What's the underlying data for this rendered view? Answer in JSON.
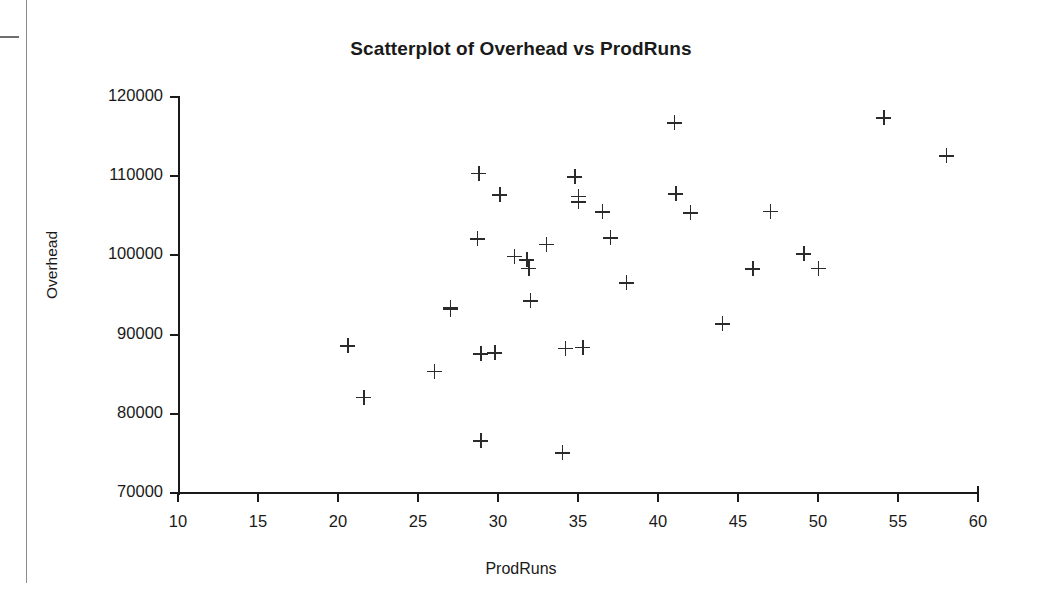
{
  "figure": {
    "title": "Scatterplot of Overhead vs ProdRuns",
    "xlabel": "ProdRuns",
    "ylabel": "Overhead"
  },
  "axes": {
    "x_ticks": [
      "10",
      "15",
      "20",
      "25",
      "30",
      "35",
      "40",
      "45",
      "50",
      "55",
      "60"
    ],
    "y_ticks": [
      "120000",
      "110000",
      "100000",
      "90000",
      "80000",
      "70000"
    ]
  },
  "chart_data": {
    "type": "scatter",
    "title": "Scatterplot of Overhead vs ProdRuns",
    "xlabel": "ProdRuns",
    "ylabel": "Overhead",
    "xlim": [
      10,
      60
    ],
    "ylim": [
      70000,
      120000
    ],
    "xticks": [
      10,
      15,
      20,
      25,
      30,
      35,
      40,
      45,
      50,
      55,
      60
    ],
    "yticks": [
      70000,
      80000,
      90000,
      100000,
      110000,
      120000
    ],
    "grid": false,
    "legend": null,
    "marker": "plus",
    "marker_color": "#2b2b2b",
    "series": [
      {
        "name": "Overhead vs ProdRuns",
        "points": [
          [
            20.6,
            88600
          ],
          [
            21.6,
            82100
          ],
          [
            26.0,
            85400
          ],
          [
            27.0,
            93200
          ],
          [
            27.0,
            93400
          ],
          [
            28.7,
            102100
          ],
          [
            28.8,
            110400
          ],
          [
            28.9,
            87600
          ],
          [
            28.9,
            76600
          ],
          [
            29.8,
            87700
          ],
          [
            30.1,
            107700
          ],
          [
            31.0,
            99900
          ],
          [
            31.8,
            99500
          ],
          [
            31.9,
            98400
          ],
          [
            32.0,
            94300
          ],
          [
            33.0,
            101400
          ],
          [
            34.0,
            75100
          ],
          [
            34.2,
            88300
          ],
          [
            34.8,
            109900
          ],
          [
            35.0,
            107500
          ],
          [
            35.0,
            106800
          ],
          [
            35.3,
            88400
          ],
          [
            36.5,
            105500
          ],
          [
            37.0,
            102200
          ],
          [
            38.0,
            96600
          ],
          [
            41.0,
            116800
          ],
          [
            41.1,
            107800
          ],
          [
            42.0,
            105400
          ],
          [
            44.0,
            91400
          ],
          [
            45.9,
            98300
          ],
          [
            47.0,
            105600
          ],
          [
            49.1,
            100200
          ],
          [
            50.0,
            98400
          ],
          [
            54.1,
            117400
          ],
          [
            58.0,
            112600
          ]
        ]
      }
    ]
  },
  "artifacts": {
    "gutter_line": "scan-gutter-line",
    "margin_dash": "scan-margin-dash"
  }
}
